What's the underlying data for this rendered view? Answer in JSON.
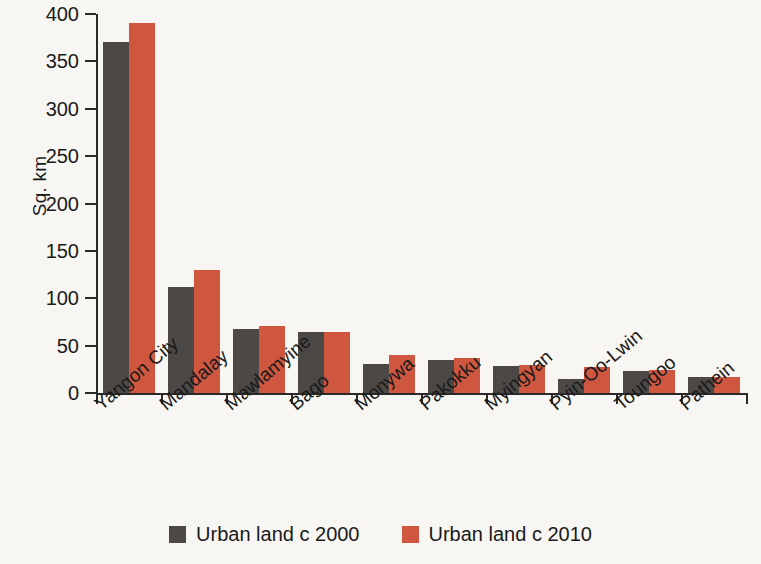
{
  "chart_data": {
    "type": "bar",
    "title": "",
    "subtitle": "",
    "xlabel": "",
    "ylabel": "Sq. km",
    "ylim": [
      0,
      400
    ],
    "yticks": [
      0,
      50,
      100,
      150,
      200,
      250,
      300,
      350,
      400
    ],
    "grid": false,
    "legend_position": "bottom",
    "categories": [
      "Yangon City",
      "Mandalay",
      "Mawlamyine",
      "Bago",
      "Monywa",
      "Pakokku",
      "Myingyan",
      "Pyin-Oo-Lwin",
      "Toungoo",
      "Pathein"
    ],
    "series": [
      {
        "name": "Urban land c 2000",
        "color": "#4b4846",
        "values": [
          370,
          112,
          68,
          64,
          31,
          35,
          28,
          15,
          23,
          17
        ]
      },
      {
        "name": "Urban land c 2010",
        "color": "#cf5740",
        "values": [
          390,
          130,
          71,
          64,
          40,
          37,
          30,
          27,
          24,
          17
        ]
      }
    ]
  },
  "colors": {
    "background": "#f7f6f3",
    "axis": "#2a2a2a",
    "series_2000": "#4b4846",
    "series_2010": "#cf5740"
  }
}
